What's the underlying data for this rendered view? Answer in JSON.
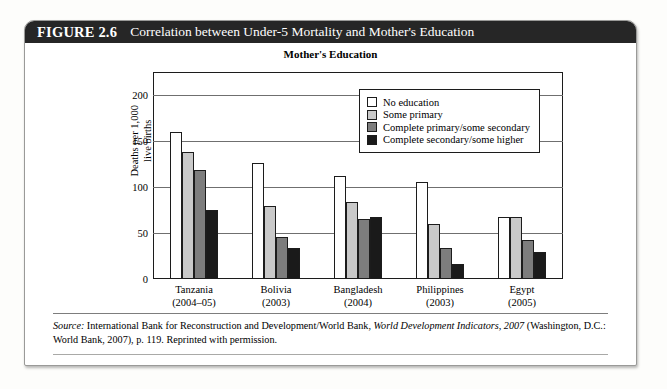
{
  "figure": {
    "number": "FIGURE 2.6",
    "title": "Correlation between Under-5 Mortality and Mother's Education"
  },
  "source": {
    "label": "Source:",
    "text_part1": " International Bank for Reconstruction and Development/World Bank, ",
    "italic_title": "World Development Indicators, 2007",
    "text_part2": " (Washington, D.C.: World Bank, 2007), p. 119. Reprinted with permission."
  },
  "chart_data": {
    "type": "bar",
    "title": "Mother's Education",
    "xlabel": "",
    "ylabel": "Deaths per 1,000\nlive births",
    "ylim": [
      0,
      225
    ],
    "yticks": [
      0,
      50,
      100,
      150,
      200
    ],
    "ytick_labels": [
      "0",
      "50",
      "100",
      "150",
      "200"
    ],
    "grid": true,
    "legend_position": "upper-right-inside",
    "categories": [
      "Tanzania",
      "Bolivia",
      "Bangladesh",
      "Philippines",
      "Egypt"
    ],
    "category_years": [
      "(2004–05)",
      "(2003)",
      "(2004)",
      "(2003)",
      "(2005)"
    ],
    "series": [
      {
        "name": "No education",
        "color": "#ffffff",
        "values": [
          160,
          126,
          112,
          105,
          67
        ]
      },
      {
        "name": "Some primary",
        "color": "#c9c9c9",
        "values": [
          138,
          79,
          84,
          60,
          67
        ]
      },
      {
        "name": "Complete primary/some secondary",
        "color": "#7d7d7d",
        "values": [
          119,
          46,
          65,
          34,
          42
        ]
      },
      {
        "name": "Complete secondary/some higher",
        "color": "#1a1a1a",
        "values": [
          75,
          34,
          67,
          16,
          29
        ]
      }
    ]
  }
}
